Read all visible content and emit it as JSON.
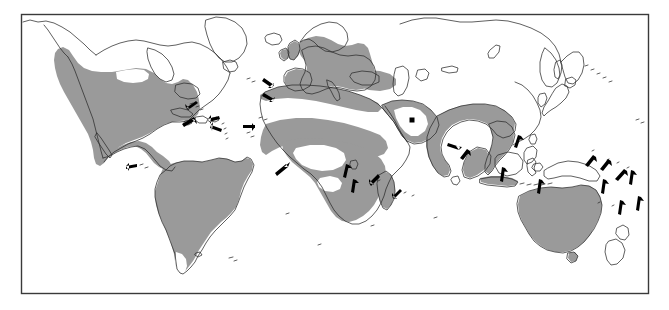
{
  "figure": {
    "type": "map",
    "projection": "rectangular",
    "frame": {
      "x": 21,
      "y": 14,
      "width": 627,
      "height": 279
    }
  },
  "colors": {
    "background": "#ffffff",
    "frame_stroke": "#3a3a3a",
    "coastline_stroke": "#2b2b2b",
    "range_fill": "#9a9a9a",
    "unshaded_fill": "#ffffff",
    "arrow_fill": "#000000",
    "point_locality_fill": "#000000"
  },
  "legend": {
    "shown": false,
    "implied_items": [
      {
        "symbol": "grey-fill",
        "label": "Continuous distribution range",
        "color": "#9a9a9a"
      },
      {
        "symbol": "arrow",
        "label": "Island / small locality record",
        "color": "#000000"
      },
      {
        "symbol": "square-dot",
        "label": "Isolated inland record",
        "color": "#000000"
      }
    ]
  },
  "shaded_regions": [
    {
      "id": "north-america",
      "label": "United States and Mexico",
      "note": "Shaded from the Pacific Northwest south through Mexico and the Gulf coast; an unshaded notch in the northern interior plains."
    },
    {
      "id": "central-america",
      "label": "Central America"
    },
    {
      "id": "south-america",
      "label": "South America",
      "note": "Shaded except for the southernmost tip of Patagonia, which is white."
    },
    {
      "id": "western-europe",
      "label": "Western and Central Europe with the British Isles"
    },
    {
      "id": "north-africa-coast",
      "label": "Mediterranean North Africa"
    },
    {
      "id": "sahel",
      "label": "Sahel belt and West Africa"
    },
    {
      "id": "southern-africa",
      "label": "Central and southern Africa"
    },
    {
      "id": "madagascar",
      "label": "Madagascar"
    },
    {
      "id": "arabia",
      "label": "Arabian Peninsula margins"
    },
    {
      "id": "india-perimeter",
      "label": "Northern and eastern India, Indochina",
      "note": "Shaded perimeter band with an unshaded interior over the Deccan plateau."
    },
    {
      "id": "sumatra-java",
      "label": "Sumatra, Java and the Lesser Sunda chain"
    },
    {
      "id": "australia",
      "label": "Australia"
    }
  ],
  "unshaded_inclusions": [
    {
      "id": "sahara",
      "label": "Sahara Desert"
    },
    {
      "id": "congo-basin",
      "label": "Congo Basin / equatorial Africa"
    },
    {
      "id": "deccan",
      "label": "Indian interior"
    },
    {
      "id": "patagonia-tip",
      "label": "Southern Patagonia"
    },
    {
      "id": "us-interior-notch",
      "label": "Northern interior plains"
    },
    {
      "id": "kalahari-gap",
      "label": "Angola / Kalahari gap"
    }
  ],
  "arrows": [
    {
      "id": "arrow-bahamas",
      "points_to": "Bahamas",
      "direction": "down-left"
    },
    {
      "id": "arrow-greater-antilles",
      "points_to": "Hispaniola",
      "direction": "down-right"
    },
    {
      "id": "arrow-puerto-rico",
      "points_to": "Puerto Rico",
      "direction": "left"
    },
    {
      "id": "arrow-lesser-antilles",
      "points_to": "Lesser Antilles",
      "direction": "left"
    },
    {
      "id": "arrow-galapagos",
      "points_to": "Galapagos Islands",
      "direction": "left"
    },
    {
      "id": "arrow-azores",
      "points_to": "Azores",
      "direction": "down-right"
    },
    {
      "id": "arrow-madeira",
      "points_to": "Madeira",
      "direction": "down-right"
    },
    {
      "id": "arrow-canary",
      "points_to": "Canary Islands",
      "direction": "right"
    },
    {
      "id": "arrow-gulf-guinea",
      "points_to": "Gulf of Guinea islands",
      "direction": "up-right"
    },
    {
      "id": "arrow-lake-victoria",
      "points_to": "Lake Victoria region",
      "direction": "up"
    },
    {
      "id": "arrow-lake-tanganyika",
      "points_to": "East African lakes",
      "direction": "up"
    },
    {
      "id": "arrow-comoros",
      "points_to": "Comoros",
      "direction": "down-left"
    },
    {
      "id": "arrow-mascarene",
      "points_to": "Mascarene Islands",
      "direction": "down-left"
    },
    {
      "id": "arrow-sri-lanka",
      "points_to": "Sri Lanka",
      "direction": "right"
    },
    {
      "id": "arrow-andaman",
      "points_to": "Andaman region",
      "direction": "up-right"
    },
    {
      "id": "arrow-philippines",
      "points_to": "Philippines",
      "direction": "up"
    },
    {
      "id": "arrow-borneo",
      "points_to": "Borneo / Sulawesi",
      "direction": "up"
    },
    {
      "id": "arrow-new-guinea-w",
      "points_to": "Western New Guinea",
      "direction": "up"
    },
    {
      "id": "arrow-bismarck",
      "points_to": "Bismarck Archipelago",
      "direction": "up-right"
    },
    {
      "id": "arrow-solomons",
      "points_to": "Solomon Islands",
      "direction": "up-right"
    },
    {
      "id": "arrow-vanuatu",
      "points_to": "Vanuatu",
      "direction": "up-right"
    },
    {
      "id": "arrow-new-caledonia",
      "points_to": "New Caledonia",
      "direction": "up"
    },
    {
      "id": "arrow-fiji",
      "points_to": "Fiji",
      "direction": "up"
    },
    {
      "id": "arrow-samoa",
      "points_to": "Samoa",
      "direction": "up"
    },
    {
      "id": "arrow-tonga",
      "points_to": "Tonga",
      "direction": "up"
    }
  ],
  "point_localities": [
    {
      "id": "dot-arabia",
      "label": "Central Arabian Peninsula record",
      "x": 412,
      "y": 120
    }
  ],
  "arrow_count": 25,
  "point_count": 1
}
